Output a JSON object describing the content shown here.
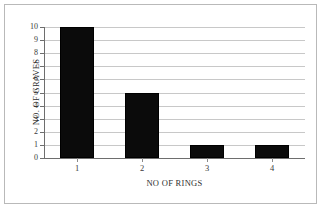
{
  "chart_data": {
    "type": "bar",
    "title": "",
    "subtitle": "",
    "categories": [
      "1",
      "2",
      "3",
      "4"
    ],
    "values": [
      10,
      5,
      1,
      1
    ],
    "series": [
      {
        "name": "NO. OF GRAVES",
        "values": [
          10,
          5,
          1,
          1
        ]
      }
    ],
    "xlabel": "NO OF RINGS",
    "ylabel": "NO. OF GRAVES",
    "ylim": [
      0,
      10
    ],
    "y_ticks": [
      0,
      1,
      2,
      3,
      4,
      5,
      6,
      7,
      8,
      9,
      10
    ],
    "y_tick_labels": [
      "0",
      "1",
      "2",
      "3",
      "4",
      "5",
      "6",
      "7",
      "8",
      "9",
      "10"
    ],
    "x_tick_labels": [
      "1",
      "2",
      "3",
      "4"
    ],
    "grid": {
      "horizontal": true,
      "vertical": false
    },
    "legend": {
      "visible": false,
      "position": "none"
    },
    "annotations": [],
    "colors": {
      "bar": "#0b0b0b",
      "gridline": "#c8c8c8",
      "axis": "#6e6e6e",
      "text": "#2f2f2f",
      "background": "#ffffff",
      "frame": "#b9b9b9"
    }
  }
}
